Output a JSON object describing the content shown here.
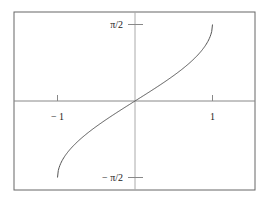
{
  "chart_data": {
    "type": "line",
    "title": "",
    "xlabel": "",
    "ylabel": "",
    "function": "arcsin(x)",
    "xlim": [
      -1.55,
      1.55
    ],
    "ylim": [
      -1.7,
      1.7
    ],
    "x_ticks": [
      {
        "value": -1,
        "label": "− 1"
      },
      {
        "value": 1,
        "label": "1"
      }
    ],
    "y_ticks": [
      {
        "value": 1.5708,
        "label": "π/2"
      },
      {
        "value": -1.5708,
        "label": "− π/2"
      }
    ],
    "grid": false,
    "series": [
      {
        "name": "arcsin",
        "x": [
          -1,
          -0.99,
          -0.95,
          -0.9,
          -0.8,
          -0.7,
          -0.6,
          -0.5,
          -0.4,
          -0.3,
          -0.2,
          -0.1,
          0,
          0.1,
          0.2,
          0.3,
          0.4,
          0.5,
          0.6,
          0.7,
          0.8,
          0.9,
          0.95,
          0.99,
          1
        ],
        "y": [
          -1.5708,
          -1.4293,
          -1.2532,
          -1.1198,
          -0.9273,
          -0.7754,
          -0.6435,
          -0.5236,
          -0.4115,
          -0.3047,
          -0.2014,
          -0.1002,
          0,
          0.1002,
          0.2014,
          0.3047,
          0.4115,
          0.5236,
          0.6435,
          0.7754,
          0.9273,
          1.1198,
          1.2532,
          1.4293,
          1.5708
        ]
      }
    ]
  },
  "colors": {
    "frame": "#666666",
    "axis": "#999999",
    "curve": "#555555"
  }
}
